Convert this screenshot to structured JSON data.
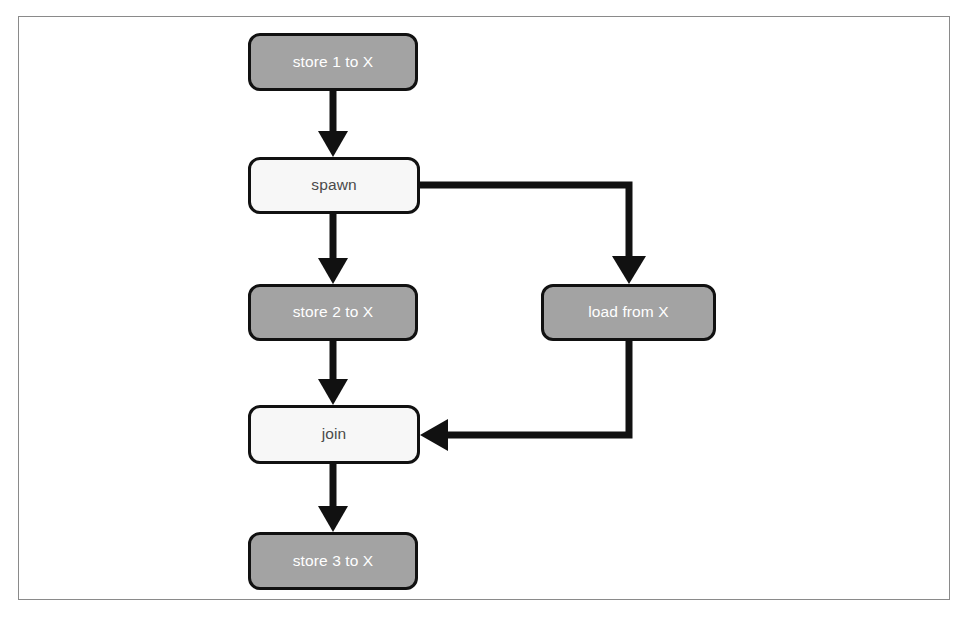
{
  "figure": {
    "type": "flowchart",
    "background_color": "#ffffff",
    "frame_color": "#8a8a8a",
    "filled_node_color": "#a3a3a3",
    "filled_node_text_color": "#ffffff",
    "open_node_color": "#f7f7f7",
    "open_node_text_color": "#4a4a4a",
    "node_border_color": "#111111",
    "arrow_color": "#111111",
    "caption": ""
  },
  "nodes": [
    {
      "id": "store1",
      "label": "store 1 to X",
      "style": "filled",
      "x": 248,
      "y": 33,
      "w": 170,
      "h": 58
    },
    {
      "id": "spawn",
      "label": "spawn",
      "style": "open",
      "x": 248,
      "y": 157,
      "w": 172,
      "h": 57
    },
    {
      "id": "store2",
      "label": "store 2 to X",
      "style": "filled",
      "x": 248,
      "y": 284,
      "w": 170,
      "h": 57
    },
    {
      "id": "load",
      "label": "load from X",
      "style": "filled",
      "x": 541,
      "y": 284,
      "w": 175,
      "h": 57
    },
    {
      "id": "join",
      "label": "join",
      "style": "open",
      "x": 248,
      "y": 405,
      "w": 172,
      "h": 59
    },
    {
      "id": "store3",
      "label": "store 3 to X",
      "style": "filled",
      "x": 248,
      "y": 532,
      "w": 170,
      "h": 58
    }
  ],
  "edges": [
    {
      "id": "e1",
      "from": "store1",
      "to": "spawn",
      "shape": "vertical"
    },
    {
      "id": "e2",
      "from": "spawn",
      "to": "store2",
      "shape": "vertical"
    },
    {
      "id": "e3",
      "from": "spawn",
      "to": "load",
      "shape": "right-then-down"
    },
    {
      "id": "e4",
      "from": "store2",
      "to": "join",
      "shape": "vertical"
    },
    {
      "id": "e5",
      "from": "load",
      "to": "join",
      "shape": "down-then-left"
    },
    {
      "id": "e6",
      "from": "join",
      "to": "store3",
      "shape": "vertical"
    }
  ]
}
